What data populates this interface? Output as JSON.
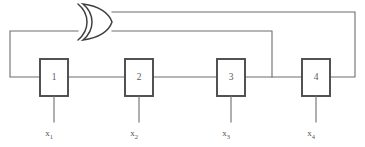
{
  "diagram": {
    "type": "lfsr",
    "stage_count": 4,
    "gate": {
      "name": "xor-gate",
      "label": "XOR",
      "symbol": "⊕"
    },
    "registers": [
      {
        "number": "1",
        "variable": "x",
        "subscript": "1"
      },
      {
        "number": "2",
        "variable": "x",
        "subscript": "2"
      },
      {
        "number": "3",
        "variable": "x",
        "subscript": "3"
      },
      {
        "number": "4",
        "variable": "x",
        "subscript": "4"
      }
    ],
    "taps": [
      {
        "from_stage": "3",
        "to": "xor-gate"
      },
      {
        "from_stage": "4",
        "to": "xor-gate"
      }
    ],
    "colors": {
      "background": "#ffffff",
      "wire": "#6d6d6d",
      "box_border": "#4a4a4a",
      "gate_stroke": "#3f3f3f",
      "text": "#555555"
    }
  }
}
